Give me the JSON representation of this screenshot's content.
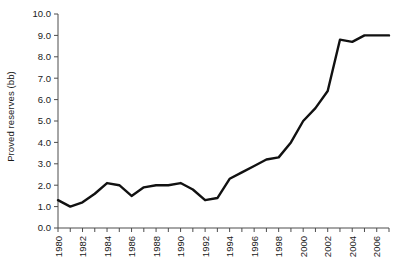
{
  "chart_data": {
    "type": "line",
    "title": "",
    "xlabel": "",
    "ylabel": "Proved reserves (bb)",
    "x": [
      1980,
      1981,
      1982,
      1983,
      1984,
      1985,
      1986,
      1987,
      1988,
      1989,
      1990,
      1991,
      1992,
      1993,
      1994,
      1995,
      1996,
      1997,
      1998,
      1999,
      2000,
      2001,
      2002,
      2003,
      2004,
      2005,
      2006,
      2007
    ],
    "values": [
      1.3,
      1.0,
      1.2,
      1.6,
      2.1,
      2.0,
      1.5,
      1.9,
      2.0,
      2.0,
      2.1,
      1.8,
      1.3,
      1.4,
      2.3,
      2.6,
      2.9,
      3.2,
      3.3,
      4.0,
      5.0,
      5.6,
      6.4,
      8.8,
      8.7,
      9.0,
      9.0,
      9.0
    ],
    "ylim": [
      0.0,
      10.0
    ],
    "xlim": [
      1980,
      2007
    ],
    "ytick_values": [
      0.0,
      1.0,
      2.0,
      3.0,
      4.0,
      5.0,
      6.0,
      7.0,
      8.0,
      9.0,
      10.0
    ],
    "ytick_labels": [
      "0.0",
      "1.0",
      "2.0",
      "3.0",
      "4.0",
      "5.0",
      "6.0",
      "7.0",
      "8.0",
      "9.0",
      "10.0"
    ],
    "xtick_values": [
      1980,
      1981,
      1982,
      1983,
      1984,
      1985,
      1986,
      1987,
      1988,
      1989,
      1990,
      1991,
      1992,
      1993,
      1994,
      1995,
      1996,
      1997,
      1998,
      1999,
      2000,
      2001,
      2002,
      2003,
      2004,
      2005,
      2006,
      2007
    ],
    "xtick_labels_shown": [
      "1980",
      "1982",
      "1984",
      "1986",
      "1988",
      "1990",
      "1992",
      "1994",
      "1996",
      "1998",
      "2000",
      "2002",
      "2004",
      "2006"
    ],
    "xtick_label_rotation": -90,
    "grid": false,
    "legend": null,
    "line_color": "#111111",
    "line_width": 2.4,
    "axis_color": "#4d4d4d",
    "background": "#ffffff"
  }
}
